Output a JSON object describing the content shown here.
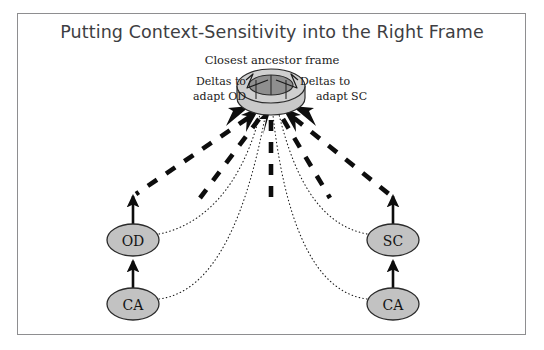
{
  "page": {
    "width": 544,
    "height": 350,
    "background": "#ffffff",
    "border_color": "#8e8e90"
  },
  "title": {
    "text": "Putting Context-Sensitivity into the Right Frame",
    "color": "#3e3e42"
  },
  "labels": {
    "closest_ancestor": "Closest ancestor frame",
    "deltas_od_line1": "Deltas to",
    "deltas_od_line2": "adapt OD",
    "deltas_sc_line1": "Deltas to",
    "deltas_sc_line2": "adapt SC"
  },
  "nodes": {
    "od": {
      "label": "OD",
      "cx": 133,
      "cy": 240,
      "rx": 26,
      "ry": 16
    },
    "ca_left": {
      "label": "CA",
      "cx": 133,
      "cy": 304,
      "rx": 26,
      "ry": 16
    },
    "sc": {
      "label": "SC",
      "cx": 393,
      "cy": 240,
      "rx": 26,
      "ry": 16
    },
    "ca_right": {
      "label": "CA",
      "cx": 393,
      "cy": 304,
      "rx": 26,
      "ry": 16
    }
  },
  "frame_object": {
    "name": "closest-ancestor-frame",
    "cx": 271,
    "cy": 86,
    "outer_rx": 34,
    "outer_ry": 17,
    "inner_rx": 22,
    "inner_ry": 10,
    "depth": 12,
    "fill_outer": "#c9c9c9",
    "fill_inner": "#8f8f8f",
    "stroke": "#2b2b2b"
  },
  "colors": {
    "node_fill": "#c2c2c2",
    "node_stroke": "#2b2b2b",
    "arrow_black": "#0d0d0d",
    "dotted_curve": "#1a1a1a"
  },
  "edges": {
    "solid_arrows": [
      {
        "name": "ca-left-to-od",
        "from": "ca_left",
        "to": "od"
      },
      {
        "name": "od-to-up",
        "from": "od",
        "to": "dashed-left"
      },
      {
        "name": "ca-right-to-sc",
        "from": "ca_right",
        "to": "sc"
      },
      {
        "name": "sc-to-up",
        "from": "sc",
        "to": "dashed-right"
      }
    ],
    "dashed_arrow_count": 5,
    "dotted_curve_count": 4
  }
}
